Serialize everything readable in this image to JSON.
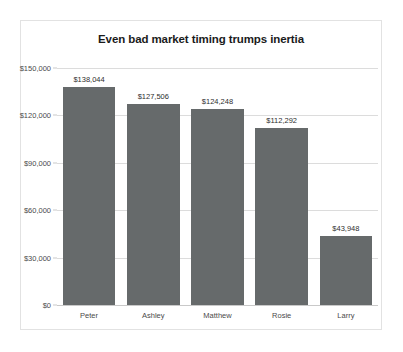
{
  "card": {
    "border_color": "#e2e2e2",
    "background": "#ffffff"
  },
  "chart_data": {
    "type": "bar",
    "title": "Even bad market timing trumps inertia",
    "xlabel": "",
    "ylabel": "",
    "categories": [
      "Peter",
      "Ashley",
      "Matthew",
      "Rosie",
      "Larry"
    ],
    "values": [
      138044,
      127506,
      124248,
      112292,
      43948
    ],
    "value_labels": [
      "$138,044",
      "$127,506",
      "$124,248",
      "$112,292",
      "$43,948"
    ],
    "ylim": [
      0,
      150000
    ],
    "yticks": [
      0,
      30000,
      60000,
      90000,
      120000,
      150000
    ],
    "ytick_labels": [
      "$0",
      "$30,000",
      "$60,000",
      "$90,000",
      "$120,000",
      "$150,000"
    ],
    "grid": true,
    "legend": false,
    "bar_color": "#666a6b",
    "gridline_color": "#dcdcdc",
    "axis_color": "#c9c9c9",
    "label_color": "#4a4a4a",
    "title_color": "#1b1b1b"
  }
}
